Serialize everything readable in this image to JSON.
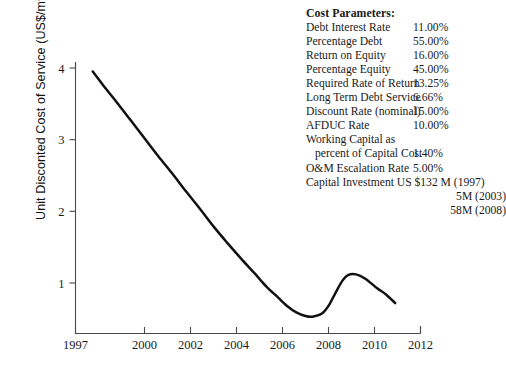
{
  "chart_data": {
    "type": "line",
    "title": "",
    "xlabel": "",
    "ylabel": "Unit Disconted Cost of Service (US$/m",
    "ylabel_sup": "3",
    "ylabel_tail": ")",
    "xlim": [
      1997,
      2012
    ],
    "ylim": [
      0,
      4.35
    ],
    "grid": false,
    "legend": "none",
    "xticks": [
      "1997",
      "2000",
      "2002",
      "2004",
      "2006",
      "2008",
      "2010",
      "2012"
    ],
    "xtick_values": [
      1997,
      2000,
      2002,
      2004,
      2006,
      2008,
      2010,
      2012
    ],
    "yticks": [
      "1",
      "2",
      "3",
      "4"
    ],
    "ytick_values": [
      1,
      2,
      3,
      4
    ],
    "series": [
      {
        "name": "Unit Discounted Cost of Service",
        "x": [
          1997.75,
          1998.2,
          1998.8,
          1999.4,
          2000.0,
          2000.6,
          2001.2,
          2001.8,
          2002.4,
          2003.0,
          2003.6,
          2004.2,
          2004.8,
          2005.3,
          2005.8,
          2006.2,
          2006.6,
          2007.0,
          2007.3,
          2007.7,
          2008.0,
          2008.3,
          2008.6,
          2008.85,
          2009.2,
          2009.6,
          2010.1,
          2010.5,
          2010.9
        ],
        "y": [
          3.95,
          3.76,
          3.52,
          3.27,
          3.02,
          2.77,
          2.53,
          2.28,
          2.04,
          1.79,
          1.56,
          1.34,
          1.13,
          0.95,
          0.8,
          0.68,
          0.59,
          0.54,
          0.53,
          0.57,
          0.68,
          0.86,
          1.03,
          1.11,
          1.12,
          1.06,
          0.93,
          0.84,
          0.72
        ]
      }
    ]
  },
  "annotations": {
    "title": "Cost Parameters:",
    "rows": [
      {
        "label": "Debt Interest Rate",
        "value": "11.00%"
      },
      {
        "label": "Percentage Debt",
        "value": "55.00%"
      },
      {
        "label": "Return on Equity",
        "value": "16.00%"
      },
      {
        "label": "Percentage Equity",
        "value": "45.00%"
      },
      {
        "label": "Required Rate of Return",
        "value": "13.25%"
      },
      {
        "label": "Long Term Debt Service",
        "value": "6.66%"
      },
      {
        "label": "Discount Rate (nominal)",
        "value": "15.00%"
      },
      {
        "label": "AFDUC Rate",
        "value": "10.00%"
      },
      {
        "label": "Working Capital as",
        "value": ""
      },
      {
        "label": "percent of Capital Cost",
        "value": "1.40%"
      },
      {
        "label": "O&M Escalation Rate",
        "value": "5.00%"
      }
    ],
    "capital_lines": [
      "Capital Investment US $132  M (1997)",
      "5M (2003)",
      "58M (2008)"
    ]
  },
  "style": {
    "line_color": "#111111",
    "axis_color": "#4a4a4a",
    "text_color": "#1a1a1a",
    "background": "#ffffff"
  }
}
